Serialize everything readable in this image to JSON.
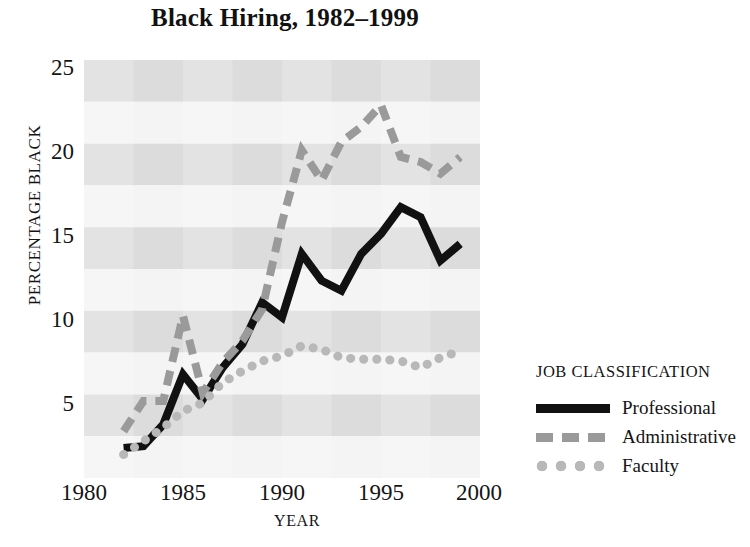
{
  "chart_data": {
    "type": "line",
    "title": "Black Hiring, 1982–1999",
    "xlabel": "YEAR",
    "ylabel": "PERCENTAGE BLACK",
    "xlim": [
      1980,
      2000
    ],
    "ylim": [
      0,
      25
    ],
    "xticks": [
      1980,
      1985,
      1990,
      1995,
      2000
    ],
    "yticks": [
      5,
      10,
      15,
      20,
      25
    ],
    "grid": false,
    "banded_background": true,
    "legend_title": "JOB CLASSIFICATION",
    "legend_position": "right",
    "x": [
      1982,
      1983,
      1984,
      1985,
      1986,
      1987,
      1988,
      1989,
      1990,
      1991,
      1992,
      1993,
      1994,
      1995,
      1996,
      1997,
      1998,
      1999
    ],
    "series": [
      {
        "name": "Professional",
        "style": "solid",
        "color": "#111111",
        "values": [
          1.8,
          1.9,
          3.2,
          6.2,
          4.7,
          6.6,
          8.0,
          10.5,
          9.6,
          13.4,
          11.8,
          11.2,
          13.4,
          14.6,
          16.2,
          15.6,
          13.0,
          14.0
        ]
      },
      {
        "name": "Administrative",
        "style": "dashed",
        "color": "#9a9a9a",
        "values": [
          2.8,
          4.6,
          4.6,
          9.7,
          5.1,
          6.9,
          8.2,
          10.1,
          15.3,
          19.6,
          17.8,
          20.1,
          21.0,
          22.3,
          19.2,
          18.9,
          18.2,
          19.2
        ]
      },
      {
        "name": "Faculty",
        "style": "dotted",
        "color": "#b8b8b8",
        "values": [
          1.4,
          2.2,
          3.0,
          4.0,
          4.5,
          5.7,
          6.4,
          7.0,
          7.3,
          7.9,
          7.7,
          7.2,
          7.1,
          7.1,
          7.0,
          6.6,
          7.2,
          7.6
        ]
      }
    ]
  },
  "legend": {
    "title": "JOB CLASSIFICATION",
    "entries": [
      {
        "label": "Professional",
        "swatch": "solid-line-swatch"
      },
      {
        "label": "Administrative",
        "swatch": "dashed-line-swatch"
      },
      {
        "label": "Faculty",
        "swatch": "dotted-line-swatch"
      }
    ]
  },
  "axes": {
    "y_tick_labels": [
      "25",
      "20",
      "15",
      "10",
      "5"
    ],
    "x_tick_labels": [
      "1980",
      "1985",
      "1990",
      "1995",
      "2000"
    ]
  }
}
